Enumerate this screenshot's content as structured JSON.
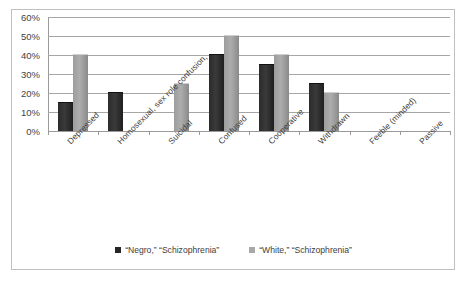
{
  "chart_data": {
    "type": "bar",
    "title": "",
    "xlabel": "",
    "ylabel": "",
    "ylim": [
      0,
      60
    ],
    "ytick_labels": [
      "60%",
      "50%",
      "40%",
      "30%",
      "20%",
      "10%",
      "0%"
    ],
    "ytick_values": [
      60,
      50,
      40,
      30,
      20,
      10,
      0
    ],
    "grid": true,
    "legend_position": "bottom",
    "categories": [
      "Depressed",
      "Homosexual, sex role confusion,",
      "Suicidal",
      "Confused",
      "Cooperative",
      "Withdrawn",
      "Feeble (minded)",
      "Passive"
    ],
    "series": [
      {
        "name": "“Negro,” “Schizophrenia”",
        "color": "#262626",
        "values": [
          15,
          20,
          0,
          40,
          35,
          25,
          0,
          0
        ]
      },
      {
        "name": "“White,” “Schizophrenia”",
        "color": "#a8a8a8",
        "values": [
          40,
          0,
          25,
          50,
          40,
          20,
          0,
          0
        ]
      }
    ]
  },
  "legend": {
    "entries": [
      {
        "label": "“Negro,” “Schizophrenia”"
      },
      {
        "label": "“White,” “Schizophrenia”"
      }
    ]
  },
  "colors": {
    "series_dark": "#262626",
    "series_light": "#a8a8a8",
    "gridline": "#a6a6a6",
    "axis": "#9a9a9a",
    "frame_border": "#bfbfbf",
    "text": "#3d3d3d",
    "background": "#ffffff"
  }
}
